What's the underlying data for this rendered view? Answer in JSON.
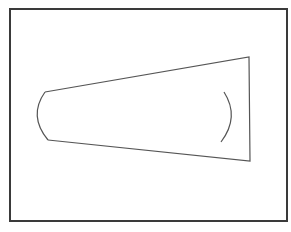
{
  "diagram": {
    "type": "tapered-lens-outline",
    "frame": {
      "x": 9,
      "y": 8,
      "width": 279,
      "height": 214,
      "border_color": "#3a3a3a"
    },
    "stroke_color": "#555555",
    "trapezoid": {
      "top_left": [
        45,
        92
      ],
      "top_right": [
        249,
        57
      ],
      "bottom_right": [
        250,
        161
      ],
      "bottom_left": [
        48,
        140
      ]
    },
    "left_arc": {
      "start": [
        45,
        92
      ],
      "control": [
        28,
        116
      ],
      "end": [
        48,
        140
      ]
    },
    "right_arc": {
      "start": [
        224,
        92
      ],
      "control": [
        240,
        117
      ],
      "end": [
        221,
        142
      ]
    }
  },
  "caption": {
    "text": ""
  }
}
